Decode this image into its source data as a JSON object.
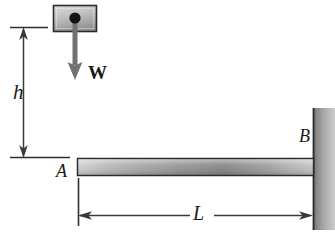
{
  "figure": {
    "background_color": "#ffffff",
    "line_color": "#1a1a1a"
  },
  "labels": {
    "height": "h",
    "weight": "W",
    "point_a": "A",
    "point_b": "B",
    "length": "L"
  },
  "elements": {
    "block": {
      "name": "falling-block",
      "x": 53,
      "y": 5,
      "width": 43,
      "height": 27,
      "fill_light": "#d2d2d2",
      "fill_dark": "#8f8f8f",
      "border_color": "#2b2b2b",
      "center_dot_radius": 5,
      "center_dot_color": "#141414"
    },
    "weight_arrow": {
      "name": "weight-force-arrow",
      "x": 75,
      "y_start": 20,
      "y_end": 80,
      "color": "#6e6e6e",
      "shaft_width": 5,
      "head_width": 14,
      "head_height": 14
    },
    "height_dimension": {
      "name": "height-dimension",
      "x": 23,
      "y_top": 27,
      "y_bottom": 157,
      "ext_top": {
        "x1": 10,
        "x2": 48,
        "y": 27
      },
      "ext_bottom": {
        "x1": 10,
        "x2": 70,
        "y": 157
      },
      "color": "#3a3a3a"
    },
    "beam": {
      "name": "cantilever-beam",
      "x": 77,
      "y": 158,
      "width": 238,
      "height": 18,
      "fill_light": "#cfcfcf",
      "fill_mid": "#9a9a9a",
      "fill_dark": "#7c7c7c",
      "border_color": "#2b2b2b"
    },
    "wall": {
      "name": "fixed-support-wall",
      "x": 313,
      "y": 108,
      "width": 22,
      "height": 122,
      "fill_dark": "#6d6d6d",
      "fill_light": "#c6c6c6",
      "edge_color": "#2b2b2b"
    },
    "length_dimension": {
      "name": "length-dimension",
      "y": 215,
      "x_left": 78,
      "x_right": 313,
      "ext_left": {
        "x": 78,
        "y1": 178,
        "y2": 226
      },
      "color": "#3a3a3a"
    }
  }
}
